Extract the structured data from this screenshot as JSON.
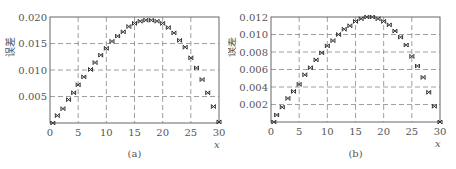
{
  "chart_data": [
    {
      "type": "scatter",
      "caption": "(a)",
      "title": "",
      "xlabel": "x",
      "ylabel": "误差",
      "xlim": [
        0,
        30
      ],
      "ylim": [
        0,
        0.02
      ],
      "xticks": [
        "0",
        "5",
        "10",
        "15",
        "20",
        "25",
        "30"
      ],
      "yticks": [
        "0.005",
        "0.010",
        "0.015",
        "0.020"
      ],
      "grid": "dashed",
      "marker": "x",
      "x": [
        0.5,
        1.3,
        2.3,
        3.3,
        4.2,
        5,
        6,
        7.2,
        8,
        9,
        10,
        11,
        12,
        13,
        14,
        15,
        16,
        17,
        18,
        19,
        20,
        21,
        22,
        23,
        24,
        25,
        26,
        27,
        28,
        29,
        30
      ],
      "y": [
        0.0,
        0.0014,
        0.0027,
        0.0044,
        0.0057,
        0.0072,
        0.0087,
        0.0101,
        0.0114,
        0.0128,
        0.0141,
        0.0154,
        0.0164,
        0.0172,
        0.0182,
        0.0188,
        0.0192,
        0.0194,
        0.0194,
        0.0192,
        0.0188,
        0.018,
        0.017,
        0.0156,
        0.0143,
        0.0123,
        0.0104,
        0.0082,
        0.0057,
        0.0031,
        0.0002
      ]
    },
    {
      "type": "scatter",
      "caption": "(b)",
      "title": "",
      "xlabel": "x",
      "ylabel": "误差",
      "xlim": [
        0,
        30
      ],
      "ylim": [
        0,
        0.012
      ],
      "xticks": [
        "0",
        "5",
        "10",
        "15",
        "20",
        "25",
        "30"
      ],
      "yticks": [
        "0.002",
        "0.004",
        "0.006",
        "0.008",
        "0.010",
        "0.012"
      ],
      "grid": "dashed",
      "marker": "x",
      "x": [
        0.5,
        1,
        2,
        3,
        4,
        5,
        6,
        7,
        8,
        9,
        10,
        11,
        12,
        13,
        14,
        15,
        16,
        17,
        18,
        19,
        20,
        21,
        22,
        23,
        24,
        25,
        26,
        27,
        28,
        29,
        30
      ],
      "y": [
        0.0,
        0.0008,
        0.0017,
        0.0027,
        0.0035,
        0.0043,
        0.0054,
        0.0062,
        0.0071,
        0.0079,
        0.0087,
        0.0093,
        0.01,
        0.0106,
        0.011,
        0.0115,
        0.0118,
        0.012,
        0.012,
        0.0118,
        0.0115,
        0.0111,
        0.0104,
        0.0097,
        0.0088,
        0.0075,
        0.0064,
        0.0051,
        0.0034,
        0.0018,
        0.0
      ]
    }
  ],
  "colors": {
    "axis": "#666666",
    "grid": "#888888",
    "marker": "#333333",
    "text": "#555555"
  }
}
